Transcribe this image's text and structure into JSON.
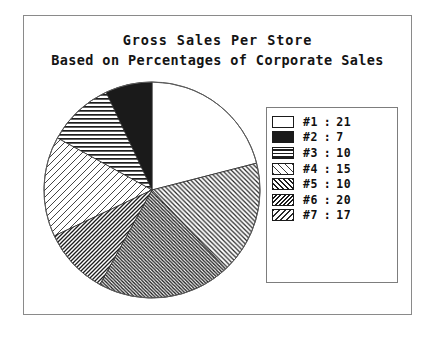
{
  "chart_data": {
    "type": "pie",
    "title": "Gross Sales Per Store",
    "subtitle": "Based on Percentages of Corporate Sales",
    "xlabel": "",
    "ylabel": "",
    "unit": "percent",
    "total": 100,
    "legend_position": "right",
    "grid": false,
    "categories": [
      "#1",
      "#2",
      "#3",
      "#4",
      "#5",
      "#6",
      "#7"
    ],
    "values": [
      21,
      7,
      10,
      15,
      10,
      20,
      17
    ],
    "slices": [
      {
        "label": "#1",
        "value": 21,
        "pattern": "solid-white",
        "fill": "#ffffff"
      },
      {
        "label": "#2",
        "value": 7,
        "pattern": "solid-black",
        "fill": "#1a1a1a"
      },
      {
        "label": "#3",
        "value": 10,
        "pattern": "horizontal-lines",
        "fill": "#ffffff"
      },
      {
        "label": "#4",
        "value": 15,
        "pattern": "diagonal-forward-light",
        "fill": "#ffffff"
      },
      {
        "label": "#5",
        "value": 10,
        "pattern": "diagonal-forward-dense",
        "fill": "#ffffff"
      },
      {
        "label": "#6",
        "value": 20,
        "pattern": "diagonal-back-dense",
        "fill": "#ffffff"
      },
      {
        "label": "#7",
        "value": 17,
        "pattern": "diagonal-back-medium",
        "fill": "#ffffff"
      }
    ],
    "legend": [
      {
        "key": "#1",
        "separator": ":",
        "value": "21"
      },
      {
        "key": "#2",
        "separator": ":",
        "value": "7"
      },
      {
        "key": "#3",
        "separator": ":",
        "value": "10"
      },
      {
        "key": "#4",
        "separator": ":",
        "value": "15"
      },
      {
        "key": "#5",
        "separator": ":",
        "value": "10"
      },
      {
        "key": "#6",
        "separator": ":",
        "value": "20"
      },
      {
        "key": "#7",
        "separator": ":",
        "value": "17"
      }
    ]
  },
  "colors": {
    "ink": "#111111",
    "frame": "#8a8a8a",
    "legend_border": "#7d7d7d",
    "background": "#ffffff"
  }
}
